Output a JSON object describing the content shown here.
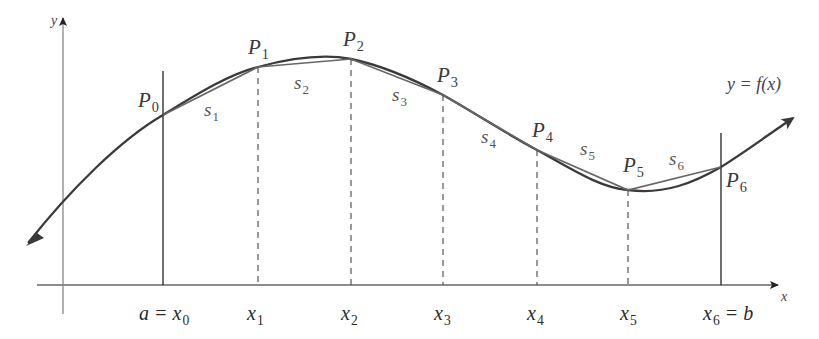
{
  "diagram": {
    "axes": {
      "x_label": "x",
      "y_label": "y"
    },
    "function_label": "y = f(x)",
    "points": [
      {
        "name": "P",
        "sub": "0",
        "x": 163,
        "y": 115
      },
      {
        "name": "P",
        "sub": "1",
        "x": 258,
        "y": 67
      },
      {
        "name": "P",
        "sub": "2",
        "x": 351,
        "y": 59
      },
      {
        "name": "P",
        "sub": "3",
        "x": 443,
        "y": 95
      },
      {
        "name": "P",
        "sub": "4",
        "x": 537,
        "y": 150
      },
      {
        "name": "P",
        "sub": "5",
        "x": 628,
        "y": 190
      },
      {
        "name": "P",
        "sub": "6",
        "x": 721,
        "y": 167
      }
    ],
    "segments": [
      {
        "name": "s",
        "sub": "1"
      },
      {
        "name": "s",
        "sub": "2"
      },
      {
        "name": "s",
        "sub": "3"
      },
      {
        "name": "s",
        "sub": "4"
      },
      {
        "name": "s",
        "sub": "5"
      },
      {
        "name": "s",
        "sub": "6"
      }
    ],
    "x_ticks": [
      {
        "pre": "a = x",
        "sub": "0",
        "post": ""
      },
      {
        "pre": "x",
        "sub": "1",
        "post": ""
      },
      {
        "pre": "x",
        "sub": "2",
        "post": ""
      },
      {
        "pre": "x",
        "sub": "3",
        "post": ""
      },
      {
        "pre": "x",
        "sub": "4",
        "post": ""
      },
      {
        "pre": "x",
        "sub": "5",
        "post": ""
      },
      {
        "pre": "x",
        "sub": "6",
        "post": " = b"
      }
    ],
    "colors": {
      "curve": "#3a3a3a",
      "chord": "#666666",
      "axis": "#555555",
      "text": "#333333"
    }
  }
}
